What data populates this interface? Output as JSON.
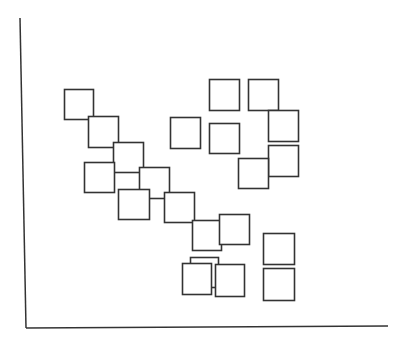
{
  "chart_data": {
    "type": "scatter",
    "title": "",
    "xlabel": "",
    "ylabel": "",
    "marker": "square",
    "grid": false,
    "legend": null,
    "stroke_color": "#333333",
    "axes": {
      "y_axis": {
        "x1": 20,
        "y1": 18,
        "x2": 26,
        "y2": 328
      },
      "x_axis": {
        "x1": 26,
        "y1": 328,
        "x2": 388,
        "y2": 326
      }
    },
    "points": [
      {
        "x": 64,
        "y": 89,
        "w": 29,
        "h": 30
      },
      {
        "x": 88,
        "y": 116,
        "w": 30,
        "h": 31
      },
      {
        "x": 113,
        "y": 142,
        "w": 30,
        "h": 30
      },
      {
        "x": 84,
        "y": 162,
        "w": 30,
        "h": 30
      },
      {
        "x": 139,
        "y": 167,
        "w": 30,
        "h": 31
      },
      {
        "x": 118,
        "y": 189,
        "w": 31,
        "h": 30
      },
      {
        "x": 164,
        "y": 192,
        "w": 30,
        "h": 30
      },
      {
        "x": 192,
        "y": 220,
        "w": 29,
        "h": 30
      },
      {
        "x": 219,
        "y": 214,
        "w": 30,
        "h": 30
      },
      {
        "x": 170,
        "y": 117,
        "w": 30,
        "h": 31
      },
      {
        "x": 209,
        "y": 79,
        "w": 30,
        "h": 31
      },
      {
        "x": 248,
        "y": 79,
        "w": 30,
        "h": 31
      },
      {
        "x": 268,
        "y": 110,
        "w": 30,
        "h": 31
      },
      {
        "x": 209,
        "y": 123,
        "w": 30,
        "h": 30
      },
      {
        "x": 268,
        "y": 145,
        "w": 30,
        "h": 31
      },
      {
        "x": 238,
        "y": 158,
        "w": 30,
        "h": 30
      },
      {
        "x": 263,
        "y": 233,
        "w": 31,
        "h": 31
      },
      {
        "x": 263,
        "y": 268,
        "w": 31,
        "h": 32
      },
      {
        "x": 190,
        "y": 257,
        "w": 28,
        "h": 30
      },
      {
        "x": 182,
        "y": 263,
        "w": 29,
        "h": 31
      },
      {
        "x": 215,
        "y": 264,
        "w": 29,
        "h": 32
      }
    ]
  }
}
